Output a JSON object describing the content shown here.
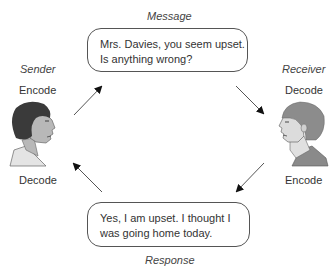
{
  "diagram": {
    "type": "communication-cycle",
    "message": {
      "label": "Message",
      "text_line1": "Mrs. Davies, you seem upset.",
      "text_line2": "Is anything wrong?"
    },
    "response": {
      "label": "Response",
      "text_line1": "Yes, I am upset. I thought I",
      "text_line2": "was going home today."
    },
    "sender": {
      "label": "Sender",
      "top_action": "Encode",
      "bottom_action": "Decode"
    },
    "receiver": {
      "label": "Receiver",
      "top_action": "Decode",
      "bottom_action": "Encode"
    },
    "flows": [
      {
        "from": "sender",
        "to": "message"
      },
      {
        "from": "message",
        "to": "receiver"
      },
      {
        "from": "receiver",
        "to": "response"
      },
      {
        "from": "response",
        "to": "sender"
      }
    ]
  },
  "colors": {
    "sender_hair": "#3a3a3a",
    "sender_skin": "#b8b8b8",
    "receiver_hair": "#8c8c8c",
    "receiver_skin": "#d8d8d8",
    "arrow": "#111111",
    "bubble_border": "#555555"
  }
}
